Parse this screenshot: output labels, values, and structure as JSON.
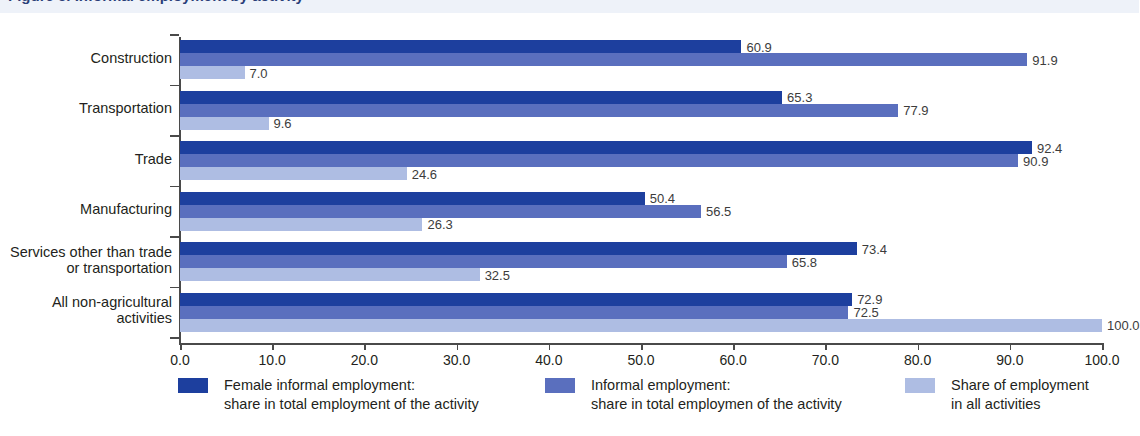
{
  "title_strip": {
    "text": "Figure 5. Informal employment by activity"
  },
  "chart_data": {
    "type": "bar",
    "orientation": "horizontal",
    "title": "",
    "xlabel": "",
    "ylabel": "",
    "xlim": [
      0.0,
      100.0
    ],
    "xticks": [
      "0.0",
      "10.0",
      "20.0",
      "30.0",
      "40.0",
      "50.0",
      "60.0",
      "70.0",
      "80.0",
      "90.0",
      "100.0"
    ],
    "grid": false,
    "legend_position": "bottom",
    "categories": [
      "Construction",
      "Transportation",
      "Trade",
      "Manufacturing",
      "Services other than trade\nor transportation",
      "All non-agricultural\nactivities"
    ],
    "series": [
      {
        "name": "Female informal employment:\nshare in total employment of the activity",
        "color": "#1d3f9e",
        "values": [
          60.9,
          65.3,
          92.4,
          50.4,
          73.4,
          72.9
        ],
        "labels": [
          "60.9",
          "65.3",
          "92.4",
          "50.4",
          "73.4",
          "72.9"
        ]
      },
      {
        "name": "Informal employment:\nshare in total employmen of the activity",
        "color": "#5a6fbe",
        "values": [
          91.9,
          77.9,
          90.9,
          56.5,
          65.8,
          72.5
        ],
        "labels": [
          "91.9",
          "77.9",
          "90.9",
          "56.5",
          "65.8",
          "72.5"
        ]
      },
      {
        "name": "Share of employment\nin all activities",
        "color": "#aebde3",
        "values": [
          7.0,
          9.6,
          24.6,
          26.3,
          32.5,
          100.0
        ],
        "labels": [
          "7.0",
          "9.6",
          "24.6",
          "26.3",
          "32.5",
          "100.0"
        ]
      }
    ]
  },
  "legend": [
    {
      "label": "Female informal employment:\nshare in total employment of the activity",
      "color": "#1d3f9e"
    },
    {
      "label": "Informal employment:\nshare in total employmen of the activity",
      "color": "#5a6fbe"
    },
    {
      "label": "Share of employment\nin all activities",
      "color": "#aebde3"
    }
  ]
}
